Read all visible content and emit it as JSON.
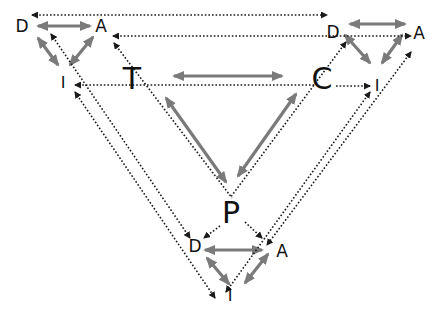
{
  "diagram": {
    "colors": {
      "gray_arrow": "#7a7a7a",
      "dotted_arrow": "#1a1a1a",
      "background": "#ffffff"
    },
    "center": {
      "T": {
        "label": "T",
        "x": 132,
        "y": 79
      },
      "C": {
        "label": "C",
        "x": 322,
        "y": 79
      },
      "P": {
        "label": "P",
        "x": 231,
        "y": 213
      }
    },
    "triads": {
      "top_left": {
        "D": {
          "label": "D",
          "x": 22,
          "y": 26
        },
        "A": {
          "label": "A",
          "x": 101,
          "y": 26
        },
        "I": {
          "label": "I",
          "x": 63,
          "y": 83
        }
      },
      "top_right": {
        "D": {
          "label": "D",
          "x": 333,
          "y": 32
        },
        "A": {
          "label": "A",
          "x": 419,
          "y": 33
        },
        "I": {
          "label": "I",
          "x": 377,
          "y": 86
        }
      },
      "bottom": {
        "D": {
          "label": "D",
          "x": 195,
          "y": 246
        },
        "A": {
          "label": "A",
          "x": 282,
          "y": 251
        },
        "I": {
          "label": "I",
          "x": 230,
          "y": 296
        }
      }
    },
    "gray_arrows": [
      {
        "name": "tl-d-a",
        "x1": 38,
        "y1": 26,
        "x2": 90,
        "y2": 26
      },
      {
        "name": "tl-d-i",
        "x1": 38,
        "y1": 38,
        "x2": 58,
        "y2": 65
      },
      {
        "name": "tl-a-i",
        "x1": 93,
        "y1": 37,
        "x2": 70,
        "y2": 65
      },
      {
        "name": "tr-d-a",
        "x1": 350,
        "y1": 24,
        "x2": 405,
        "y2": 24
      },
      {
        "name": "tr-d-i",
        "x1": 345,
        "y1": 35,
        "x2": 370,
        "y2": 63
      },
      {
        "name": "tr-a-i",
        "x1": 402,
        "y1": 35,
        "x2": 382,
        "y2": 63
      },
      {
        "name": "t-c",
        "x1": 174,
        "y1": 76,
        "x2": 282,
        "y2": 76
      },
      {
        "name": "t-p",
        "x1": 166,
        "y1": 98,
        "x2": 226,
        "y2": 182
      },
      {
        "name": "c-p",
        "x1": 296,
        "y1": 94,
        "x2": 238,
        "y2": 176
      },
      {
        "name": "b-d-a",
        "x1": 205,
        "y1": 250,
        "x2": 262,
        "y2": 250
      },
      {
        "name": "b-d-i",
        "x1": 207,
        "y1": 258,
        "x2": 229,
        "y2": 284
      },
      {
        "name": "b-a-i",
        "x1": 268,
        "y1": 254,
        "x2": 245,
        "y2": 283
      }
    ],
    "dotted_arrows": [
      {
        "name": "top-long",
        "x1": 32,
        "y1": 15,
        "x2": 327,
        "y2": 15,
        "start": true,
        "end": true
      },
      {
        "name": "tr-a-to-left",
        "x1": 113,
        "y1": 36,
        "x2": 411,
        "y2": 36,
        "start": true,
        "end": true
      },
      {
        "name": "c-to-tl-i",
        "x1": 75,
        "y1": 85,
        "x2": 318,
        "y2": 85,
        "start": true,
        "end": false
      },
      {
        "name": "c-to-tr-i",
        "x1": 336,
        "y1": 86,
        "x2": 370,
        "y2": 86,
        "start": false,
        "end": true
      },
      {
        "name": "tl-a-diag-1",
        "x1": 51,
        "y1": 34,
        "x2": 190,
        "y2": 238,
        "start": true,
        "end": true
      },
      {
        "name": "tl-a-diag-2",
        "x1": 75,
        "y1": 92,
        "x2": 215,
        "y2": 298,
        "start": true,
        "end": true
      },
      {
        "name": "t-diag",
        "x1": 114,
        "y1": 43,
        "x2": 232,
        "y2": 198,
        "start": true,
        "end": false
      },
      {
        "name": "c-diag-to-trd",
        "x1": 346,
        "y1": 42,
        "x2": 230,
        "y2": 198,
        "start": true,
        "end": false
      },
      {
        "name": "tr-i-diag",
        "x1": 370,
        "y1": 92,
        "x2": 226,
        "y2": 292,
        "start": true,
        "end": true
      },
      {
        "name": "tr-a-diag",
        "x1": 411,
        "y1": 52,
        "x2": 267,
        "y2": 245,
        "start": true,
        "end": true
      },
      {
        "name": "p-to-bd",
        "x1": 220,
        "y1": 226,
        "x2": 204,
        "y2": 238,
        "start": false,
        "end": true
      },
      {
        "name": "p-to-ba",
        "x1": 245,
        "y1": 222,
        "x2": 262,
        "y2": 238,
        "start": false,
        "end": true
      }
    ]
  }
}
